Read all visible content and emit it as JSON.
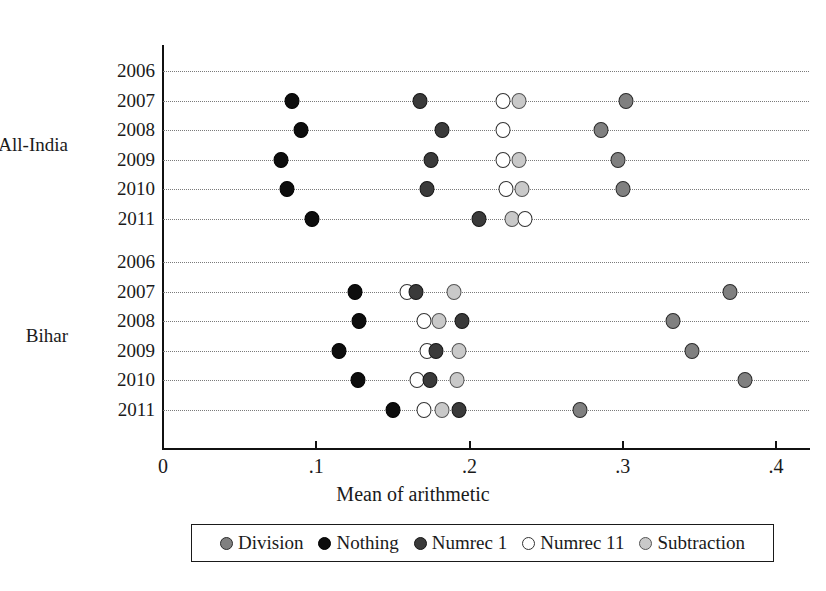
{
  "chart_data": {
    "type": "scatter",
    "title": "",
    "xlabel": "Mean of arithmetic",
    "ylabel": "",
    "xlim": [
      0,
      0.4
    ],
    "xticks": [
      0,
      0.1,
      0.2,
      0.3,
      0.4
    ],
    "xtick_labels": [
      "0",
      ".1",
      ".2",
      ".3",
      ".4"
    ],
    "grid": true,
    "legend_position": "bottom",
    "legend": [
      "Division",
      "Nothing",
      "Numrec 1",
      "Numrec 11",
      "Subtraction"
    ],
    "series_colors": {
      "Division": "#808080",
      "Nothing": "#0d0d0d",
      "Numrec 1": "#3a3a3a",
      "Numrec 11": "#ffffff",
      "Subtraction": "#c9c9c9"
    },
    "groups": [
      {
        "name": "All-India",
        "rows": [
          {
            "year": "2006",
            "points": []
          },
          {
            "year": "2007",
            "points": [
              {
                "series": "Nothing",
                "value": 0.084
              },
              {
                "series": "Numrec 1",
                "value": 0.168
              },
              {
                "series": "Numrec 11",
                "value": 0.222
              },
              {
                "series": "Subtraction",
                "value": 0.232
              },
              {
                "series": "Division",
                "value": 0.302
              }
            ]
          },
          {
            "year": "2008",
            "points": [
              {
                "series": "Nothing",
                "value": 0.09
              },
              {
                "series": "Numrec 1",
                "value": 0.182
              },
              {
                "series": "Numrec 11",
                "value": 0.222
              },
              {
                "series": "Division",
                "value": 0.286
              }
            ]
          },
          {
            "year": "2009",
            "points": [
              {
                "series": "Nothing",
                "value": 0.077
              },
              {
                "series": "Numrec 1",
                "value": 0.175
              },
              {
                "series": "Numrec 11",
                "value": 0.222
              },
              {
                "series": "Subtraction",
                "value": 0.232
              },
              {
                "series": "Division",
                "value": 0.297
              }
            ]
          },
          {
            "year": "2010",
            "points": [
              {
                "series": "Nothing",
                "value": 0.081
              },
              {
                "series": "Numrec 1",
                "value": 0.172
              },
              {
                "series": "Numrec 11",
                "value": 0.224
              },
              {
                "series": "Subtraction",
                "value": 0.234
              },
              {
                "series": "Division",
                "value": 0.3
              }
            ]
          },
          {
            "year": "2011",
            "points": [
              {
                "series": "Nothing",
                "value": 0.097
              },
              {
                "series": "Numrec 1",
                "value": 0.206
              },
              {
                "series": "Subtraction",
                "value": 0.228
              },
              {
                "series": "Numrec 11",
                "value": 0.236
              }
            ]
          }
        ]
      },
      {
        "name": "Bihar",
        "rows": [
          {
            "year": "2006",
            "points": []
          },
          {
            "year": "2007",
            "points": [
              {
                "series": "Nothing",
                "value": 0.125
              },
              {
                "series": "Numrec 11",
                "value": 0.159
              },
              {
                "series": "Numrec 1",
                "value": 0.165
              },
              {
                "series": "Subtraction",
                "value": 0.19
              },
              {
                "series": "Division",
                "value": 0.37
              }
            ]
          },
          {
            "year": "2008",
            "points": [
              {
                "series": "Nothing",
                "value": 0.128
              },
              {
                "series": "Numrec 11",
                "value": 0.17
              },
              {
                "series": "Subtraction",
                "value": 0.18
              },
              {
                "series": "Numrec 1",
                "value": 0.195
              },
              {
                "series": "Division",
                "value": 0.333
              }
            ]
          },
          {
            "year": "2009",
            "points": [
              {
                "series": "Nothing",
                "value": 0.115
              },
              {
                "series": "Numrec 11",
                "value": 0.172
              },
              {
                "series": "Numrec 1",
                "value": 0.178
              },
              {
                "series": "Subtraction",
                "value": 0.193
              },
              {
                "series": "Division",
                "value": 0.345
              }
            ]
          },
          {
            "year": "2010",
            "points": [
              {
                "series": "Nothing",
                "value": 0.127
              },
              {
                "series": "Numrec 11",
                "value": 0.166
              },
              {
                "series": "Numrec 1",
                "value": 0.174
              },
              {
                "series": "Subtraction",
                "value": 0.192
              },
              {
                "series": "Division",
                "value": 0.38
              }
            ]
          },
          {
            "year": "2011",
            "points": [
              {
                "series": "Nothing",
                "value": 0.15
              },
              {
                "series": "Numrec 11",
                "value": 0.17
              },
              {
                "series": "Subtraction",
                "value": 0.182
              },
              {
                "series": "Numrec 1",
                "value": 0.193
              },
              {
                "series": "Division",
                "value": 0.272
              }
            ]
          }
        ]
      }
    ]
  }
}
